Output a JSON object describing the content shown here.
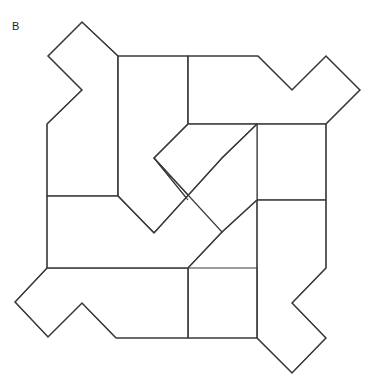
{
  "figure": {
    "label": "B",
    "title": "",
    "background_color": "#ffffff",
    "stroke_color": "#3a3a3c",
    "fill_color": "#ffffff",
    "stroke_width": 1.15,
    "viewbox": "0 0 373 384",
    "symmetry": "4-fold rotational",
    "piece_count": 8,
    "pieces": [
      {
        "name": "top-left-tall-piece",
        "points": "118,56 118,196 47,196 47,124 82,90 48,56 82,22 118,56"
      },
      {
        "name": "top-middle-piece",
        "points": "118,56 188,56 188,124 154,158 188,200 154,233 118,196 118,56"
      },
      {
        "name": "top-right-wing-piece",
        "points": "188,56 258,56 292,90 326,56 360,90 326,124 188,124 188,56"
      },
      {
        "name": "right-tall-piece",
        "points": "326,124 326,200 257,200 257,124 188,124 154,158 188,200 222,158 257,124"
      },
      {
        "name": "right-lower-piece",
        "points": "326,200 326,268 292,303 326,338 292,373 257,338 257,200 326,200"
      },
      {
        "name": "bottom-right-piece",
        "points": "188,268 257,268 257,338 188,338 188,268"
      },
      {
        "name": "bottom-left-wing-piece",
        "points": "47,268 188,268 188,338 116,338 82,303 48,337 15,302 47,268"
      },
      {
        "name": "left-tall-piece",
        "points": "47,196 118,196 154,233 188,200 222,158 257,124 257,200 222,232 188,268 47,268 47,196"
      }
    ],
    "edges": [
      {
        "name": "outer-top-left-zigzag",
        "path": "M 47,124 L 47,56.5 L 82,22 L 118,56"
      },
      {
        "name": "outer-top-left-notch",
        "path": "M 48,56 L 82,90 L 47,124"
      },
      {
        "name": "outer-top-horizontal",
        "path": "M 118,56 L 258,56"
      },
      {
        "name": "outer-top-right-zigzag",
        "path": "M 258,56 L 292,90 L 326,56 L 360,90 L 326,124"
      },
      {
        "name": "outer-right-vertical-upper",
        "path": "M 326,124 L 326,268"
      },
      {
        "name": "outer-right-zigzag-lower",
        "path": "M 326,268 L 292,303 L 326,338 L 292,373 L 257,338"
      },
      {
        "name": "outer-bottom-horizontal",
        "path": "M 257,338 L 116,338"
      },
      {
        "name": "outer-bottom-left-zigzag",
        "path": "M 116,338 L 82,303 L 48,337 L 15,302 L 47,268"
      },
      {
        "name": "outer-left-vertical",
        "path": "M 47,268 L 47,124"
      },
      {
        "name": "inner-vertical-top-left",
        "path": "M 118,56 L 118,196"
      },
      {
        "name": "inner-vertical-top-mid",
        "path": "M 188,56 L 188,124"
      },
      {
        "name": "inner-horizontal-upper-right",
        "path": "M 188,124 L 326,124"
      },
      {
        "name": "inner-horizontal-left-mid",
        "path": "M 47,196 L 118,196"
      },
      {
        "name": "inner-horizontal-right-mid",
        "path": "M 257,200 L 326,200"
      },
      {
        "name": "inner-vertical-right",
        "path": "M 257,200 L 257,338"
      },
      {
        "name": "inner-horizontal-lower-left",
        "path": "M 47,268 L 188,268"
      },
      {
        "name": "inner-vertical-bottom",
        "path": "M 188,268 L 188,338"
      },
      {
        "name": "inner-diagonal-nw",
        "path": "M 188,124 L 154,158 L 188,200"
      },
      {
        "name": "inner-diagonal-sw",
        "path": "M 118,196 L 154,233 L 188,200"
      },
      {
        "name": "inner-diagonal-ne",
        "path": "M 222,158 L 257,124"
      },
      {
        "name": "inner-diagonal-se",
        "path": "M 154,158 L 222,232 L 257,200"
      },
      {
        "name": "inner-diagonal-center-cross",
        "path": "M 222,158 L 154,233"
      },
      {
        "name": "inner-diagonal-south",
        "path": "M 222,232 L 188,268"
      }
    ]
  }
}
